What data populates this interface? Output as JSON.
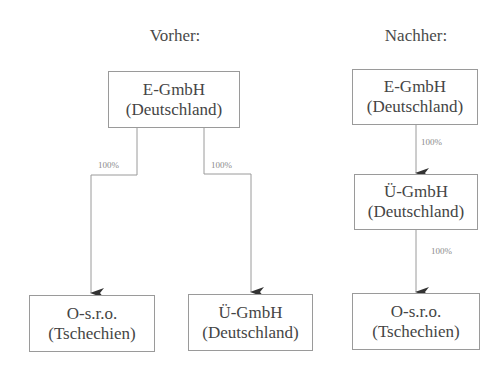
{
  "before": {
    "title": "Vorher:",
    "parent": {
      "name": "E-GmbH",
      "country": "(Deutschland)"
    },
    "children": [
      {
        "name": "O-s.r.o.",
        "country": "(Tschechien)",
        "share": "100%"
      },
      {
        "name": "Ü-GmbH",
        "country": "(Deutschland)",
        "share": "100%"
      }
    ]
  },
  "after": {
    "title": "Nachher:",
    "top": {
      "name": "E-GmbH",
      "country": "(Deutschland)"
    },
    "middle": {
      "name": "Ü-GmbH",
      "country": "(Deutschland)",
      "share": "100%"
    },
    "bottom": {
      "name": "O-s.r.o.",
      "country": "(Tschechien)",
      "share": "100%"
    }
  },
  "colors": {
    "line": "#9a9a9a",
    "arrow": "#333333",
    "text": "#454545"
  }
}
